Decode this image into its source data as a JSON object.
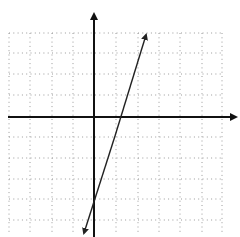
{
  "figure": {
    "grid": {
      "style": "dotted",
      "color": "#9a9a9a",
      "x_range": [
        -4,
        6
      ],
      "y_range": [
        -5,
        4
      ]
    },
    "axes": {
      "color": "#111111",
      "x_arrow": "right",
      "y_arrow": "up"
    },
    "line": {
      "equation": "y = 3x - 4",
      "slope": 3,
      "y_intercept": -4,
      "color": "#222222",
      "arrows": "both-ends"
    }
  }
}
